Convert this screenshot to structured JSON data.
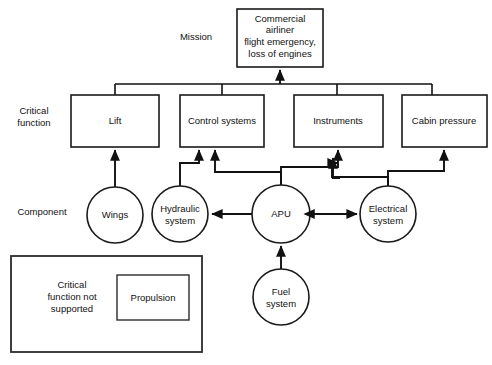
{
  "diagram": {
    "row_labels": [
      {
        "id": "mission",
        "label": "Mission"
      },
      {
        "id": "critical-function",
        "label": "Critical\nfunction",
        "lines": [
          "Critical",
          "function"
        ]
      },
      {
        "id": "component",
        "label": "Component"
      }
    ],
    "mission_node": {
      "id": "mission-box",
      "lines": [
        "Commercial",
        "airliner",
        "flight emergency,",
        "loss of engines"
      ],
      "shape": "rect"
    },
    "critical_functions": [
      {
        "id": "lift",
        "label": "Lift",
        "shape": "rect"
      },
      {
        "id": "control-systems",
        "label": "Control systems",
        "shape": "rect"
      },
      {
        "id": "instruments",
        "label": "Instruments",
        "shape": "rect"
      },
      {
        "id": "cabin-pressure",
        "label": "Cabin pressure",
        "shape": "rect"
      }
    ],
    "components": [
      {
        "id": "wings",
        "label": "Wings",
        "lines": [
          "Wings"
        ],
        "shape": "circle"
      },
      {
        "id": "hydraulic-system",
        "label": "Hydraulic system",
        "lines": [
          "Hydraulic",
          "system"
        ],
        "shape": "circle"
      },
      {
        "id": "apu",
        "label": "APU",
        "lines": [
          "APU"
        ],
        "shape": "circle"
      },
      {
        "id": "electrical-system",
        "label": "Electrical system",
        "lines": [
          "Electrical",
          "system"
        ],
        "shape": "circle"
      },
      {
        "id": "fuel-system",
        "label": "Fuel system",
        "lines": [
          "Fuel",
          "system"
        ],
        "shape": "circle"
      }
    ],
    "legend": {
      "id": "legend-box",
      "caption_lines": [
        "Critical",
        "function not",
        "supported"
      ],
      "item_label": "Propulsion"
    },
    "edges": [
      {
        "from": "critical-function-bus",
        "to": "mission-box",
        "arrow": "single"
      },
      {
        "from": "lift",
        "to": "bus",
        "arrow": "none"
      },
      {
        "from": "control-systems",
        "to": "bus",
        "arrow": "none"
      },
      {
        "from": "instruments",
        "to": "bus",
        "arrow": "none"
      },
      {
        "from": "cabin-pressure",
        "to": "bus",
        "arrow": "none"
      },
      {
        "from": "wings",
        "to": "lift",
        "arrow": "single"
      },
      {
        "from": "hydraulic-system",
        "to": "control-systems",
        "arrow": "single"
      },
      {
        "from": "apu",
        "to": "control-systems",
        "arrow": "single"
      },
      {
        "from": "apu",
        "to": "instruments",
        "arrow": "single"
      },
      {
        "from": "electrical-system",
        "to": "instruments",
        "arrow": "single"
      },
      {
        "from": "electrical-system",
        "to": "cabin-pressure",
        "arrow": "single"
      },
      {
        "from": "apu",
        "to": "hydraulic-system",
        "arrow": "single"
      },
      {
        "from": "apu",
        "to": "electrical-system",
        "arrow": "double"
      },
      {
        "from": "fuel-system",
        "to": "apu",
        "arrow": "single"
      }
    ],
    "colors": {
      "stroke": "#111111",
      "fill": "#ffffff",
      "text": "#111111",
      "legend_stroke": "#2b2b2b"
    }
  }
}
